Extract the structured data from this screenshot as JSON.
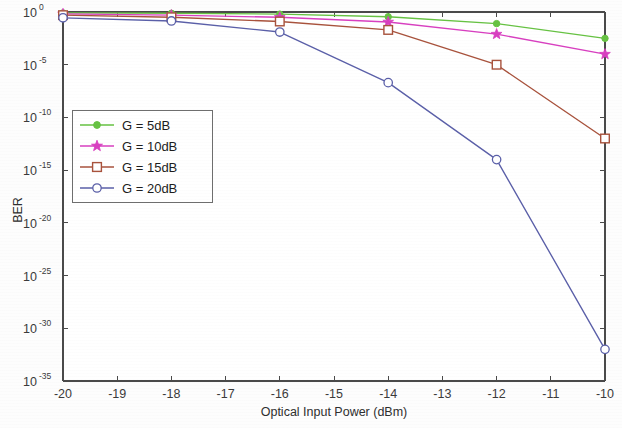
{
  "chart_data": {
    "type": "line",
    "title": "",
    "xlabel": "Optical Input Power (dBm)",
    "ylabel": "BER",
    "xlim": [
      -20,
      -10
    ],
    "ylim_log10": [
      -35,
      0
    ],
    "yscale": "log",
    "grid": false,
    "legend_position": "upper-left-inset",
    "x": [
      -20,
      -18,
      -16,
      -14,
      -12,
      -10
    ],
    "xticklabels": [
      "-20",
      "-19",
      "-18",
      "-17",
      "-16",
      "-15",
      "-14",
      "-13",
      "-12",
      "-11",
      "-10"
    ],
    "xticks": [
      -20,
      -19,
      -18,
      -17,
      -16,
      -15,
      -14,
      -13,
      -12,
      -11,
      -10
    ],
    "yticks_log10": [
      0,
      -5,
      -10,
      -15,
      -20,
      -25,
      -30,
      -35
    ],
    "yticklabels": [
      {
        "mantissa": "10",
        "exponent": "0"
      },
      {
        "mantissa": "10",
        "exponent": "-5"
      },
      {
        "mantissa": "10",
        "exponent": "-10"
      },
      {
        "mantissa": "10",
        "exponent": "-15"
      },
      {
        "mantissa": "10",
        "exponent": "-20"
      },
      {
        "mantissa": "10",
        "exponent": "-25"
      },
      {
        "mantissa": "10",
        "exponent": "-30"
      },
      {
        "mantissa": "10",
        "exponent": "-35"
      }
    ],
    "series": [
      {
        "name": "G = 5dB",
        "color": "#66c242",
        "marker": "dot",
        "values_log10": [
          -0.08,
          -0.12,
          -0.2,
          -0.45,
          -1.1,
          -2.5
        ]
      },
      {
        "name": "G = 10dB",
        "color": "#d83fc0",
        "marker": "star",
        "values_log10": [
          -0.18,
          -0.3,
          -0.5,
          -0.95,
          -2.1,
          -4.0
        ]
      },
      {
        "name": "G = 15dB",
        "color": "#a8523c",
        "marker": "square",
        "values_log10": [
          -0.3,
          -0.5,
          -0.9,
          -1.7,
          -5.0,
          -12.0
        ]
      },
      {
        "name": "G = 20dB",
        "color": "#5a5fa8",
        "marker": "circle",
        "values_log10": [
          -0.55,
          -0.85,
          -1.9,
          -6.7,
          -14.0,
          -32.0
        ]
      }
    ]
  },
  "legend": {
    "entries": [
      "G = 5dB",
      "G = 10dB",
      "G = 15dB",
      "G = 20dB"
    ]
  },
  "axes": {
    "xlabel": "Optical Input Power (dBm)",
    "ylabel": "BER"
  }
}
